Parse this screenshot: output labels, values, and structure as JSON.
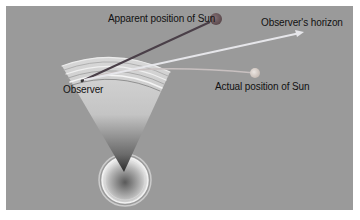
{
  "diagram": {
    "type": "atmospheric-refraction",
    "labels": {
      "apparent_sun": "Apparent position of Sun",
      "horizon": "Observer's horizon",
      "actual_sun": "Actual position of Sun",
      "observer": "Observer"
    },
    "colors": {
      "background": "#9a9a9a",
      "apparent_sun": "#6f5a5e",
      "actual_sun": "#d4cdc8",
      "sight_line": "#4a3f48",
      "horizon_line": "#e6e6ea",
      "refracted_ray": "#c8c0c0"
    }
  }
}
